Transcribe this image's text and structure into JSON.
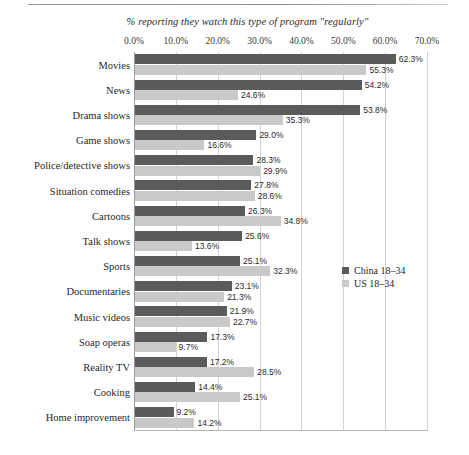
{
  "chart_data": {
    "type": "bar",
    "orientation": "horizontal",
    "title": "% reporting they watch this type of program \"regularly\"",
    "xlabel": "",
    "ylabel": "",
    "xlim": [
      0,
      70
    ],
    "grid": true,
    "legend_position": "right-middle",
    "xticks": [
      "0.0%",
      "10.0%",
      "20.0%",
      "30.0%",
      "40.0%",
      "50.0%",
      "60.0%",
      "70.0%"
    ],
    "xtick_values": [
      0,
      10,
      20,
      30,
      40,
      50,
      60,
      70
    ],
    "categories": [
      "Movies",
      "News",
      "Drama shows",
      "Game shows",
      "Police/detective shows",
      "Situation comedies",
      "Cartoons",
      "Talk shows",
      "Sports",
      "Documentaries",
      "Music videos",
      "Soap operas",
      "Reality TV",
      "Cooking",
      "Home improvement"
    ],
    "series": [
      {
        "name": "China 18–34",
        "color": "#5b5b5b",
        "values": [
          62.3,
          54.2,
          53.8,
          29.0,
          28.3,
          27.8,
          26.3,
          25.6,
          25.1,
          23.1,
          21.9,
          17.3,
          17.2,
          14.4,
          9.2
        ],
        "labels": [
          "62.3%",
          "54.2%",
          "53.8%",
          "29.0%",
          "28.3%",
          "27.8%",
          "26.3%",
          "25.6%",
          "25.1%",
          "23.1%",
          "21.9%",
          "17.3%",
          "17.2%",
          "14.4%",
          "9.2%"
        ]
      },
      {
        "name": "US 18–34",
        "color": "#c9c9c9",
        "values": [
          55.3,
          24.6,
          35.3,
          16.6,
          29.9,
          28.6,
          34.8,
          13.6,
          32.3,
          21.3,
          22.7,
          9.7,
          28.5,
          25.1,
          14.2
        ],
        "labels": [
          "55.3%",
          "24.6%",
          "35.3%",
          "16.6%",
          "29.9%",
          "28.6%",
          "34.8%",
          "13.6%",
          "32.3%",
          "21.3%",
          "22.7%",
          "9.7%",
          "28.5%",
          "25.1%",
          "14.2%"
        ]
      }
    ]
  },
  "legend": {
    "items": [
      {
        "label": "China 18–34",
        "color": "#5b5b5b"
      },
      {
        "label": "US 18–34",
        "color": "#c9c9c9"
      }
    ]
  }
}
